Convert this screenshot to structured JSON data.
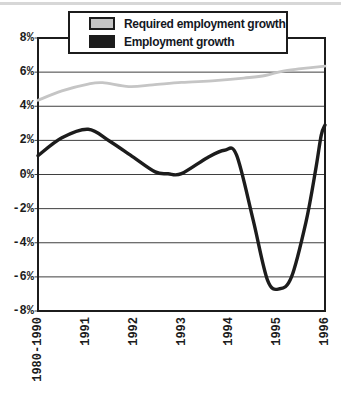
{
  "colors": {
    "background": "#ffffff",
    "frame": "#1c1c1c",
    "grid": "#3f3f3f",
    "artifact_band": "#d7d7d7"
  },
  "chart_data": {
    "type": "line",
    "title": "",
    "xlabel": "",
    "ylabel": "",
    "grid": true,
    "legend_position": "top",
    "ylim": [
      -8,
      8
    ],
    "y_gridline_step_pct": 2,
    "y_ticks": [
      "8%",
      "6%",
      "4%",
      "2%",
      "0%",
      "-2%",
      "-4%",
      "-6%",
      "-8%"
    ],
    "x_ticks": [
      "1980-1990",
      "1991",
      "1992",
      "1993",
      "1994",
      "1995",
      "1996"
    ],
    "x_unit": "tick_index (0 = 1980-1990 ... 6 = 1996)",
    "series": [
      {
        "name": "Required employment growth",
        "color": "#c5c5c5",
        "width": 2.8,
        "values_at_ticks": [
          4.4,
          5.3,
          5.2,
          5.4,
          5.6,
          6.0,
          6.4
        ],
        "curve_points": [
          [
            0,
            4.35
          ],
          [
            0.5,
            4.9
          ],
          [
            1.05,
            5.3
          ],
          [
            1.35,
            5.38
          ],
          [
            1.9,
            5.15
          ],
          [
            2.4,
            5.25
          ],
          [
            3.0,
            5.4
          ],
          [
            3.7,
            5.5
          ],
          [
            4.3,
            5.65
          ],
          [
            4.75,
            5.8
          ],
          [
            5.1,
            6.05
          ],
          [
            5.5,
            6.2
          ],
          [
            6,
            6.35
          ]
        ]
      },
      {
        "name": "Employment growth",
        "color": "#1c1c1c",
        "width": 3.4,
        "values_at_ticks": [
          1.1,
          2.6,
          1.0,
          0.1,
          1.4,
          -6.6,
          2.9
        ],
        "curve_points": [
          [
            0,
            1.1
          ],
          [
            0.5,
            2.15
          ],
          [
            1.05,
            2.65
          ],
          [
            1.5,
            1.95
          ],
          [
            2.0,
            1.0
          ],
          [
            2.45,
            0.15
          ],
          [
            2.72,
            0.04
          ],
          [
            3.0,
            0.05
          ],
          [
            3.55,
            1.0
          ],
          [
            3.9,
            1.42
          ],
          [
            4.15,
            1.15
          ],
          [
            4.5,
            -2.7
          ],
          [
            4.8,
            -6.2
          ],
          [
            5.05,
            -6.7
          ],
          [
            5.3,
            -6.0
          ],
          [
            5.6,
            -2.8
          ],
          [
            5.8,
            0.2
          ],
          [
            5.92,
            2.3
          ],
          [
            6,
            2.9
          ]
        ]
      }
    ]
  }
}
